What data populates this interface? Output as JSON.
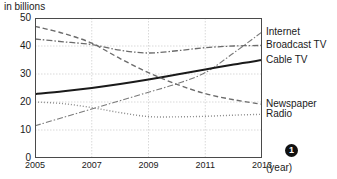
{
  "chart_data": {
    "type": "line",
    "title": "",
    "subtitle": "",
    "unit_caption": "in billions",
    "xlabel": "(year)",
    "ylabel": "",
    "x": [
      2005,
      2006,
      2007,
      2008,
      2009,
      2010,
      2011,
      2012,
      2013
    ],
    "x_ticks": [
      "2005",
      "2007",
      "2009",
      "2011",
      "2013"
    ],
    "x_tick_values": [
      2005,
      2007,
      2009,
      2011,
      2013
    ],
    "xlim": [
      2005,
      2013
    ],
    "y_ticks": [
      "0",
      "10",
      "20",
      "30",
      "40",
      "50"
    ],
    "y_tick_values": [
      0,
      10,
      20,
      30,
      40,
      50
    ],
    "ylim": [
      0,
      50
    ],
    "grid": true,
    "grid_axis": "both",
    "legend_position": "right-inline",
    "series": [
      {
        "name": "Internet",
        "style": "dash-dot",
        "color": "#7a7a7a",
        "width": 1.1,
        "label_y": 45.0,
        "values": [
          11.5,
          14.5,
          17.5,
          20.5,
          23.5,
          26.5,
          30.5,
          37.5,
          45.0
        ]
      },
      {
        "name": "Broadcast TV",
        "style": "dash-dot",
        "color": "#6b6b6b",
        "width": 1.3,
        "label_y": 40.5,
        "values": [
          42.5,
          41.5,
          40.5,
          38.5,
          37.5,
          38.3,
          39.4,
          40.0,
          40.2
        ]
      },
      {
        "name": "Cable TV",
        "style": "solid",
        "color": "#1a1a1a",
        "width": 2.0,
        "label_y": 35.0,
        "values": [
          22.8,
          23.8,
          25.0,
          26.4,
          28.0,
          29.8,
          31.6,
          33.4,
          35.0
        ]
      },
      {
        "name": "Newspaper",
        "style": "dashed",
        "color": "#6b6b6b",
        "width": 1.4,
        "label_y": 19.2,
        "values": [
          47.0,
          44.5,
          41.0,
          35.5,
          30.5,
          26.3,
          23.0,
          20.8,
          19.2
        ]
      },
      {
        "name": "Radio",
        "style": "dotted",
        "color": "#8a8a8a",
        "width": 1.4,
        "label_y": 15.6,
        "values": [
          20.0,
          19.4,
          18.0,
          16.2,
          14.8,
          14.7,
          14.9,
          15.3,
          15.6
        ]
      }
    ]
  },
  "footnote": {
    "badge": "1"
  }
}
